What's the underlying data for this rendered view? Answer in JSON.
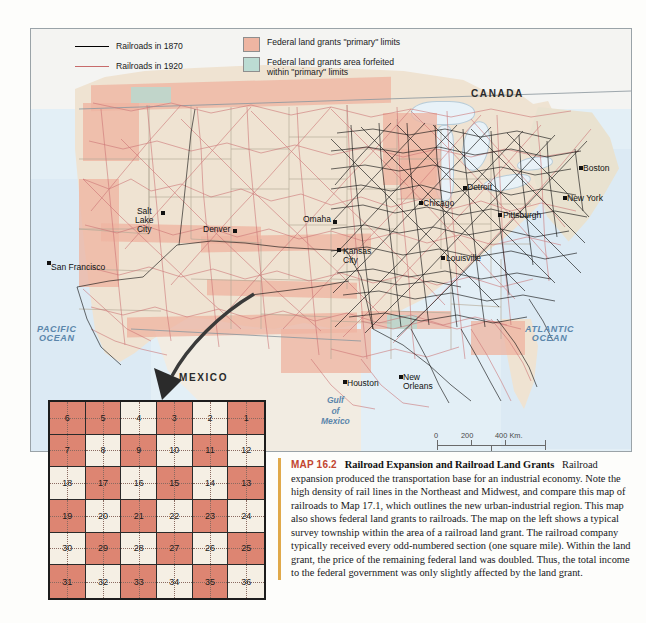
{
  "figure": {
    "map_number": "MAP 16.2",
    "title": "Railroad Expansion and Railroad Land Grants",
    "caption_body": "Railroad expansion produced the transportation base for an industrial economy. Note the high density of rail lines in the Northeast and Midwest, and compare this map of railroads to Map 17.1, which outlines the new urban-industrial region. This map also shows federal land grants to railroads. The map on the left shows a typical survey township within the area of a railroad land grant. The railroad company typically received every odd-numbered section (one square mile). Within the land grant, the price of the remaining federal land was doubled. Thus, the total income to the federal government was only slightly affected by the land grant."
  },
  "legend": {
    "items": [
      {
        "symbol": "line",
        "color": "#000000",
        "label": "Railroads in 1870"
      },
      {
        "symbol": "line",
        "color": "#c76b6b",
        "label": "Railroads in 1920"
      },
      {
        "symbol": "swatch",
        "color": "#eeb5a2",
        "label": "Federal land grants \"primary\" limits"
      },
      {
        "symbol": "swatch",
        "color": "#bcdcd3",
        "label": "Federal land grants area forfeited within \"primary\" limits"
      }
    ]
  },
  "map": {
    "regions": [
      {
        "name": "canada",
        "label": "CANADA",
        "x": 470,
        "y": 88
      },
      {
        "name": "mexico",
        "label": "MEXICO",
        "x": 178,
        "y": 372
      }
    ],
    "water_labels": [
      {
        "name": "pacific-ocean",
        "line1": "PACIFIC",
        "line2": "OCEAN",
        "x": 38,
        "y": 325
      },
      {
        "name": "atlantic-ocean",
        "line1": "ATLANTIC",
        "line2": "OCEAN",
        "x": 522,
        "y": 325
      },
      {
        "name": "gulf-of-mexico",
        "line1": "Gulf",
        "line2": "of",
        "line3": "Mexico",
        "x": 330,
        "y": 395
      }
    ],
    "cities": [
      {
        "name": "san-francisco",
        "label": "San Francisco",
        "x": 44,
        "y": 259,
        "dx": 6,
        "dy": -4
      },
      {
        "name": "salt-lake-city",
        "label": "Salt\nLake\nCity",
        "x": 148,
        "y": 215,
        "dx": -10,
        "dy": 4
      },
      {
        "name": "denver",
        "label": "Denver",
        "x": 228,
        "y": 228,
        "dx": -30,
        "dy": -4
      },
      {
        "name": "omaha",
        "label": "Omaha",
        "x": 330,
        "y": 222,
        "dx": -34,
        "dy": -4
      },
      {
        "name": "kansas-city",
        "label": "Kansas\nCity",
        "x": 337,
        "y": 250,
        "dx": 4,
        "dy": -4
      },
      {
        "name": "chicago",
        "label": "Chicago",
        "x": 417,
        "y": 200,
        "dx": -4,
        "dy": -4
      },
      {
        "name": "detroit",
        "label": "Detroit",
        "x": 462,
        "y": 186,
        "dx": 4,
        "dy": -4
      },
      {
        "name": "louisville",
        "label": "Louisville",
        "x": 440,
        "y": 256,
        "dx": 4,
        "dy": -4
      },
      {
        "name": "pittsburgh",
        "label": "Pittsburgh",
        "x": 497,
        "y": 213,
        "dx": 4,
        "dy": -4
      },
      {
        "name": "new-york",
        "label": "New York",
        "x": 562,
        "y": 196,
        "dx": 4,
        "dy": -4
      },
      {
        "name": "boston",
        "label": "Boston",
        "x": 578,
        "y": 166,
        "dx": 4,
        "dy": -4
      },
      {
        "name": "houston",
        "label": "Houston",
        "x": 342,
        "y": 380,
        "dx": 4,
        "dy": -3
      },
      {
        "name": "new-orleans",
        "label": "New\nOrleans",
        "x": 398,
        "y": 377,
        "dx": 4,
        "dy": -4
      }
    ]
  },
  "scale": {
    "km_values": [
      "0",
      "200",
      "400 Km."
    ],
    "mi_values": [
      "0",
      "200",
      "400 Mi."
    ]
  },
  "township": {
    "rows": [
      [
        "6",
        "5",
        "4",
        "3",
        "2",
        "1"
      ],
      [
        "7",
        "8",
        "9",
        "10",
        "11",
        "12"
      ],
      [
        "18",
        "17",
        "16",
        "15",
        "14",
        "13"
      ],
      [
        "19",
        "20",
        "21",
        "22",
        "23",
        "24"
      ],
      [
        "30",
        "29",
        "28",
        "27",
        "26",
        "25"
      ],
      [
        "31",
        "32",
        "33",
        "34",
        "35",
        "36"
      ]
    ],
    "granted_color": "#dd8572",
    "federal_color": "#f5efe4"
  },
  "colors": {
    "land": "#efe3d2",
    "ocean": "#dceaf4",
    "grant_primary": "#eeb5a2",
    "grant_forfeited": "#bcdcd3",
    "rail_1870": "#000000",
    "rail_1920": "#c76b6b",
    "accent_rule": "#e0a94a",
    "map_label": "#c2452f"
  }
}
